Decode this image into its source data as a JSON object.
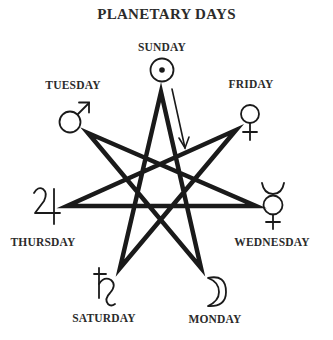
{
  "title": "PLANETARY DAYS",
  "days": {
    "sunday": {
      "label": "SUNDAY",
      "planet_icon": "sun-icon",
      "glyph": "☉"
    },
    "monday": {
      "label": "MONDAY",
      "planet_icon": "moon-icon",
      "glyph": "☽"
    },
    "tuesday": {
      "label": "TUESDAY",
      "planet_icon": "mars-icon",
      "glyph": "♂"
    },
    "wednesday": {
      "label": "WEDNESDAY",
      "planet_icon": "mercury-icon",
      "glyph": "☿"
    },
    "thursday": {
      "label": "THURSDAY",
      "planet_icon": "jupiter-icon",
      "glyph": "♃"
    },
    "friday": {
      "label": "FRIDAY",
      "planet_icon": "venus-icon",
      "glyph": "♀"
    },
    "saturday": {
      "label": "SATURDAY",
      "planet_icon": "saturn-icon",
      "glyph": "♄"
    }
  },
  "colors": {
    "ink": "#1a1a1a",
    "text": "#2b2b2b",
    "background": "#ffffff"
  }
}
